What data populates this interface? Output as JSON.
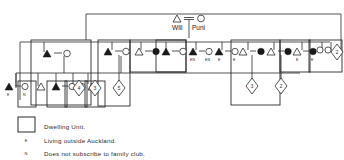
{
  "diagram": {
    "type": "kinship-pedigree-chart",
    "title_couple": {
      "male_label": "Will",
      "female_label": "Puni",
      "union_symbol": "="
    },
    "symbols": {
      "male_filled": "filled-triangle",
      "male_open": "open-triangle",
      "female_filled": "filled-circle",
      "female_open": "open-circle",
      "sibship_group": "diamond-with-count",
      "dwelling_unit": "rectangle",
      "union_link": "equals-sign"
    },
    "colors": {
      "line": "#2a2a2a",
      "fill_dark": "#1a1a1a",
      "background": "#ffffff"
    },
    "marker_codes": {
      "outside_auckland": "E",
      "not_subscribed": "N"
    },
    "generation1": [
      {
        "id": "g1-will",
        "sex": "male",
        "fill": "filled",
        "label": "Will"
      },
      {
        "id": "g1-puni",
        "sex": "female",
        "fill": "open",
        "label": "Puni"
      }
    ],
    "couples": [
      {
        "id": "c1",
        "male": "filled",
        "female": "open",
        "male_code": "",
        "female_code": "",
        "dwelling": true,
        "children": null
      },
      {
        "id": "c2",
        "male": "filled",
        "female": "open",
        "male_code": "E",
        "female_code": "N",
        "dwelling": false,
        "children": null
      },
      {
        "id": "c3",
        "male": "filled",
        "female": "open",
        "male_code": "",
        "female_code": "",
        "dwelling": true,
        "children": null
      },
      {
        "id": "c4",
        "male": "filled",
        "female": "open",
        "male_code": "",
        "female_code": "",
        "dwelling": true,
        "children": "5"
      },
      {
        "id": "c5",
        "male": "open",
        "female": "filled",
        "male_code": "",
        "female_code": "",
        "dwelling": true,
        "children": null
      },
      {
        "id": "c6",
        "male": "filled",
        "female": "open",
        "male_code": "",
        "female_code": "",
        "dwelling": true,
        "children": null
      },
      {
        "id": "c7",
        "male": "filled",
        "female": "open",
        "male_code": "EN",
        "female_code": "EN",
        "dwelling": false,
        "children": null
      },
      {
        "id": "c8",
        "male": "filled",
        "female": "open",
        "male_code": "E",
        "female_code": "E",
        "dwelling": false,
        "children": null
      },
      {
        "id": "c9",
        "male": "open",
        "female": "filled",
        "male_code": "",
        "female_code": "",
        "dwelling": true,
        "children": "3"
      },
      {
        "id": "c10",
        "male": "open",
        "female": "filled",
        "male_code": "",
        "female_code": "",
        "dwelling": true,
        "children": "2"
      },
      {
        "id": "c11",
        "male": "open",
        "female": "filled",
        "male_code": "E",
        "female_code": "E",
        "dwelling": true,
        "children": null
      }
    ],
    "sibship_markers": [
      {
        "id": "s1",
        "count": "4"
      },
      {
        "id": "s2",
        "count": "3"
      },
      {
        "id": "s3",
        "count": "2"
      }
    ],
    "unattached": [
      {
        "id": "u1",
        "sex": "female",
        "fill": "open"
      },
      {
        "id": "u2",
        "sex": "female",
        "fill": "open"
      }
    ],
    "single_males": [
      {
        "id": "m1",
        "fill": "open"
      },
      {
        "id": "m2",
        "fill": "open"
      },
      {
        "id": "m3",
        "fill": "open"
      }
    ]
  },
  "legend": {
    "items": [
      {
        "key": "dwelling",
        "marker": "",
        "text": "Dwelling Unit."
      },
      {
        "key": "outside",
        "marker": "E",
        "text": "Living outside Auckland."
      },
      {
        "key": "nosub",
        "marker": "N",
        "text": "Does not subscribe to family club."
      }
    ]
  }
}
